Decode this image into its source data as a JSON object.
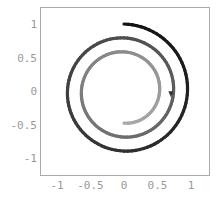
{
  "chart_data": {
    "type": "line",
    "title": "",
    "xlabel": "",
    "ylabel": "",
    "xlim": [
      -1.25,
      1.28
    ],
    "ylim": [
      -1.25,
      1.25
    ],
    "grid": false,
    "legend": null,
    "x_ticks": [
      -1,
      -0.5,
      0,
      0.5,
      1
    ],
    "x_tick_labels": [
      "-1",
      "-0.5",
      "0",
      "0.5",
      "1"
    ],
    "y_ticks": [
      1,
      0.5,
      0,
      -0.5,
      -1
    ],
    "y_tick_labels": [
      "1",
      "0.5",
      "0",
      "-0.5",
      "-1"
    ],
    "series": [
      {
        "name": "spiral",
        "description": "Clockwise spiral starting at (0, 1), radius shrinking linearly to ~0.48 after 2.5 turns, colored from black (start) to light gray (end)",
        "start_angle_deg": 90,
        "sweep_deg": -900,
        "r_start": 1.0,
        "r_end": 0.48,
        "color_start": "#111111",
        "color_end": "#aaaaaa",
        "arrow_at": {
          "x": 0.7,
          "y": -0.05
        },
        "sample_points": [
          {
            "x": 0.0,
            "y": 1.0
          },
          {
            "x": 0.95,
            "y": 0.0
          },
          {
            "x": 0.0,
            "y": -0.87
          },
          {
            "x": -0.82,
            "y": 0.0
          },
          {
            "x": 0.0,
            "y": 0.74
          },
          {
            "x": 0.7,
            "y": 0.0
          },
          {
            "x": 0.0,
            "y": -0.65
          },
          {
            "x": -0.57,
            "y": 0.0
          },
          {
            "x": 0.0,
            "y": 0.55
          },
          {
            "x": 0.52,
            "y": 0.0
          },
          {
            "x": 0.0,
            "y": -0.48
          }
        ]
      }
    ]
  },
  "frame_color": "#aaaaaa",
  "tick_color": "#999999"
}
